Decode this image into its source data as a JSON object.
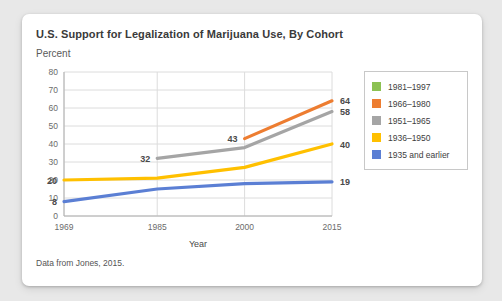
{
  "card": {
    "title": "U.S. Support for Legalization of Marijuana Use, By Cohort",
    "unit_label": "Percent",
    "source_note": "Data from Jones, 2015."
  },
  "legend": {
    "items": [
      {
        "label": "1981–1997",
        "color": "#8cc152"
      },
      {
        "label": "1966–1980",
        "color": "#ed7d31"
      },
      {
        "label": "1951–1965",
        "color": "#a5a5a5"
      },
      {
        "label": "1936–1950",
        "color": "#ffc000"
      },
      {
        "label": "1935 and earlier",
        "color": "#5b7fd4"
      }
    ]
  },
  "chart_data": {
    "type": "line",
    "title": "U.S. Support for Legalization of Marijuana Use, By Cohort",
    "xlabel": "Year",
    "ylabel": "Percent",
    "x": [
      1969,
      1985,
      2000,
      2015
    ],
    "xticks": [
      "1969",
      "1985",
      "2000",
      "2015"
    ],
    "yticks": [
      0,
      10,
      20,
      30,
      40,
      50,
      60,
      70,
      80
    ],
    "ylim": [
      0,
      80
    ],
    "xlim": [
      1969,
      2015
    ],
    "grid": true,
    "legend_position": "right",
    "series": [
      {
        "name": "1981–1997",
        "color": "#8cc152",
        "x": [],
        "values": [],
        "labels": []
      },
      {
        "name": "1966–1980",
        "color": "#ed7d31",
        "x": [
          2000,
          2015
        ],
        "values": [
          43,
          64
        ],
        "labels": [
          {
            "x": 2000,
            "y": 43,
            "text": "43",
            "side": "left"
          },
          {
            "x": 2015,
            "y": 64,
            "text": "64",
            "side": "right"
          }
        ]
      },
      {
        "name": "1951–1965",
        "color": "#a5a5a5",
        "x": [
          1985,
          2000,
          2015
        ],
        "values": [
          32,
          38,
          58
        ],
        "labels": [
          {
            "x": 1985,
            "y": 32,
            "text": "32",
            "side": "left"
          },
          {
            "x": 2015,
            "y": 58,
            "text": "58",
            "side": "right"
          }
        ]
      },
      {
        "name": "1936–1950",
        "color": "#ffc000",
        "x": [
          1969,
          1985,
          2000,
          2015
        ],
        "values": [
          20,
          21,
          27,
          40
        ],
        "labels": [
          {
            "x": 1969,
            "y": 20,
            "text": "20",
            "side": "left"
          },
          {
            "x": 2015,
            "y": 40,
            "text": "40",
            "side": "right"
          }
        ]
      },
      {
        "name": "1935 and earlier",
        "color": "#5b7fd4",
        "x": [
          1969,
          1985,
          2000,
          2015
        ],
        "values": [
          8,
          15,
          18,
          19
        ],
        "labels": [
          {
            "x": 1969,
            "y": 8,
            "text": "8",
            "side": "left"
          },
          {
            "x": 2015,
            "y": 19,
            "text": "19",
            "side": "right"
          }
        ]
      }
    ]
  }
}
